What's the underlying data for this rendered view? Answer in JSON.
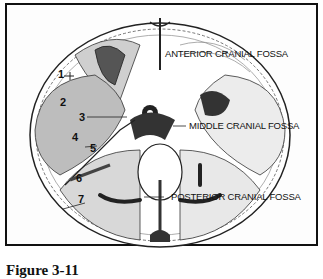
{
  "figure": {
    "labels": {
      "anterior": "ANTERIOR CRANIAL FOSSA",
      "middle": "MIDDLE CRANIAL FOSSA",
      "posterior": "POSTERIOR CRANIAL FOSSA"
    },
    "numbers": [
      "1",
      "2",
      "3",
      "4",
      "5",
      "6",
      "7"
    ],
    "caption": "Figure 3-11"
  }
}
